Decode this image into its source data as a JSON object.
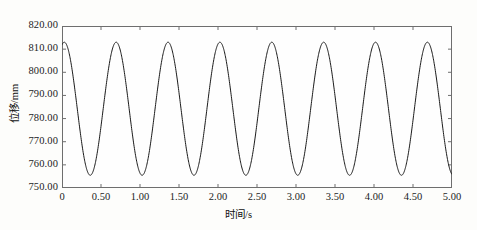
{
  "chart_data": {
    "type": "line",
    "title": "",
    "xlabel": "时间/s",
    "ylabel": "位移/mm",
    "xlim": [
      0,
      5
    ],
    "ylim": [
      750,
      820
    ],
    "xticks": [
      "0",
      "0.50",
      "1.00",
      "1.50",
      "2.00",
      "2.50",
      "3.00",
      "3.50",
      "4.00",
      "4.50",
      "5.00"
    ],
    "xtick_values": [
      0,
      0.5,
      1.0,
      1.5,
      2.0,
      2.5,
      3.0,
      3.5,
      4.0,
      4.5,
      5.0
    ],
    "yticks": [
      "750.00",
      "760.00",
      "770.00",
      "780.00",
      "790.00",
      "800.00",
      "810.00",
      "820.00"
    ],
    "ytick_values": [
      750,
      760,
      770,
      780,
      790,
      800,
      810,
      820
    ],
    "grid": false,
    "legend": false,
    "line_color": "#1a1a1a",
    "line_width": 1.0,
    "series": [
      {
        "name": "位移",
        "waveform": "sine",
        "amplitude": 28.75,
        "offset": 784.25,
        "period": 0.665,
        "frequency_hz": 1.504,
        "phase_deg": 74,
        "peak_value": 813,
        "trough_value": 755.5,
        "start_value": 810.0,
        "peak_times": [
          0.075,
          0.74,
          1.405,
          2.07,
          2.735,
          3.4,
          4.065,
          4.73
        ],
        "trough_times": [
          0.408,
          1.073,
          1.738,
          2.403,
          3.068,
          3.733,
          4.398
        ],
        "num_peaks": 8,
        "num_troughs": 7
      }
    ]
  },
  "axes": {
    "frame_color": "#6e6e6e"
  }
}
